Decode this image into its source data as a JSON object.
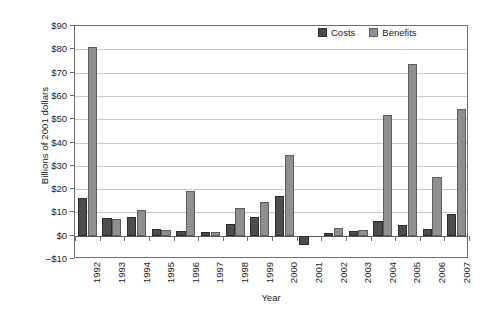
{
  "chart_data": {
    "type": "bar",
    "title": "",
    "xlabel": "Year",
    "ylabel": "Billions of 2001 dollars",
    "categories": [
      "1992",
      "1993",
      "1994",
      "1995",
      "1996",
      "1997",
      "1998",
      "1999",
      "2000",
      "2001",
      "2002",
      "2003",
      "2004",
      "2005",
      "2006",
      "2007"
    ],
    "series": [
      {
        "name": "Costs",
        "color": "#4d4d4d",
        "values": [
          16,
          7.5,
          8,
          3,
          2,
          1.5,
          5,
          8,
          17,
          -4,
          1,
          2,
          6.5,
          4.5,
          3,
          9.5
        ]
      },
      {
        "name": "Benefits",
        "color": "#8f8f8f",
        "values": [
          81,
          7,
          11,
          2.5,
          19,
          1.5,
          12,
          14.5,
          34.5,
          0,
          3.5,
          2.5,
          52,
          73.5,
          25,
          54.5
        ]
      }
    ],
    "ylim": [
      -10,
      90
    ],
    "ytick_values": [
      -10,
      0,
      10,
      20,
      30,
      40,
      50,
      60,
      70,
      80,
      90
    ],
    "ytick_labels": [
      "–$10",
      "$0",
      "$10",
      "$20",
      "$30",
      "$40",
      "$50",
      "$60",
      "$70",
      "$80",
      "$90"
    ],
    "grid": true,
    "legend_position": "top-right",
    "legend_entries": [
      "Costs",
      "Benefits"
    ]
  }
}
